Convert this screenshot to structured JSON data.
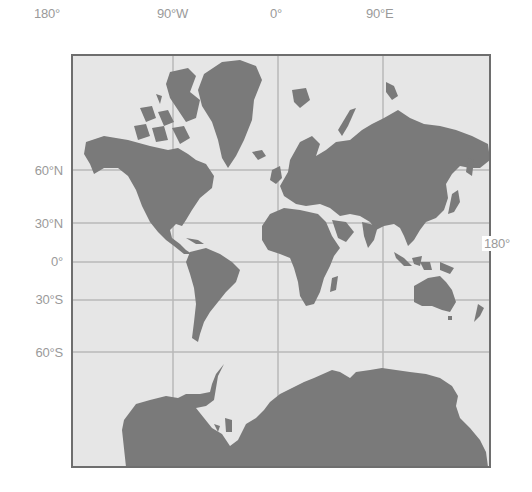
{
  "map": {
    "projection": "Mercator",
    "colors": {
      "background": "#ffffff",
      "ocean": "#e6e6e6",
      "land": "#7a7a7a",
      "grid": "#b8b8b8",
      "frame": "#6e6e6e",
      "label": "#9a9a9a"
    },
    "longitude_labels": [
      {
        "text": "180°",
        "x": 34
      },
      {
        "text": "90°W",
        "x": 157
      },
      {
        "text": "0°",
        "x": 270
      },
      {
        "text": "90°E",
        "x": 366
      }
    ],
    "latitude_labels": [
      {
        "text": "60°N",
        "y": 170
      },
      {
        "text": "30°N",
        "y": 223
      },
      {
        "text": "0°",
        "y": 262
      },
      {
        "text": "30°S",
        "y": 300
      },
      {
        "text": "60°S",
        "y": 352
      }
    ],
    "right_label": {
      "text": "180°",
      "y": 243
    },
    "regions": [
      "North America",
      "Greenland",
      "South America",
      "Europe",
      "Africa",
      "Asia",
      "Australia",
      "Antarctica"
    ]
  }
}
